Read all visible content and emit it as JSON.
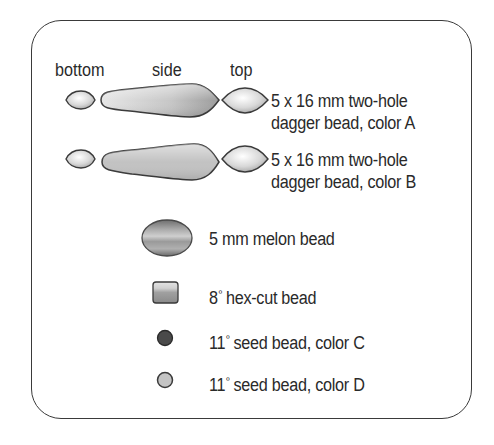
{
  "headers": {
    "bottom": "bottom",
    "side": "side",
    "top": "top"
  },
  "items": [
    {
      "id": "dagger-a",
      "line1": "5 x 16 mm two-hole",
      "line2": "dagger bead, color A",
      "icon": "dagger-bead-icon"
    },
    {
      "id": "dagger-b",
      "line1": "5 x 16 mm two-hole",
      "line2": "dagger bead, color B",
      "icon": "dagger-bead-icon"
    },
    {
      "id": "melon",
      "label": "5 mm melon bead",
      "icon": "melon-bead-icon"
    },
    {
      "id": "hex-cut",
      "size": "8",
      "ordinal": "º",
      "label": " hex-cut bead",
      "icon": "hex-cut-bead-icon"
    },
    {
      "id": "seed-c",
      "size": "11",
      "ordinal": "º",
      "label": " seed bead, color C",
      "icon": "seed-bead-icon",
      "color": "#4a4a4a"
    },
    {
      "id": "seed-d",
      "size": "11",
      "ordinal": "º",
      "label": " seed bead, color D",
      "icon": "seed-bead-icon",
      "color": "#c4c4c4"
    }
  ],
  "colors": {
    "outline": "#3a3a3a",
    "dagger_light": "#f2f2f2",
    "dagger_dark": "#9a9a9a",
    "melon": "#8a8a8a",
    "hex": "#9c9c9c",
    "seed_c": "#4a4a4a",
    "seed_d": "#c4c4c4"
  }
}
